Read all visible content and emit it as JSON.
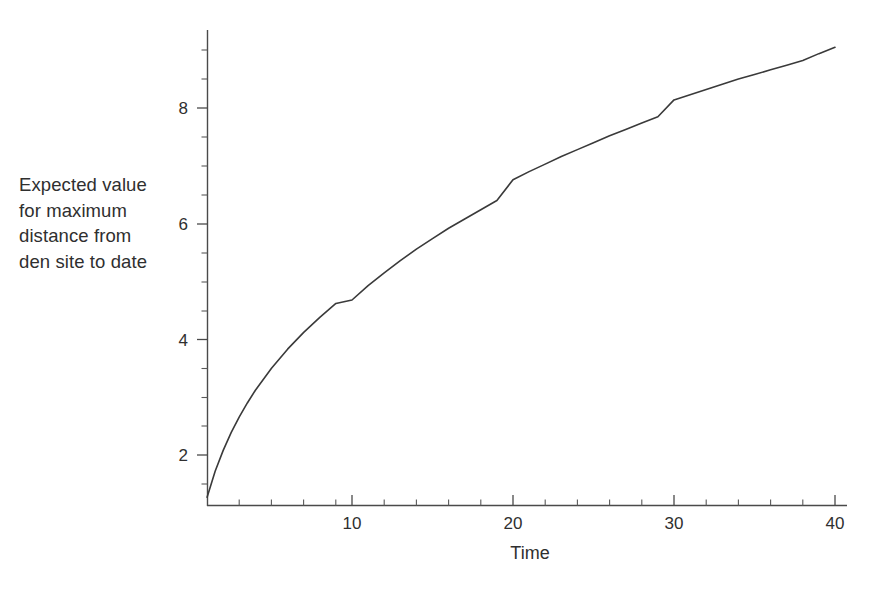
{
  "chart_data": {
    "type": "line",
    "title": "",
    "subtitle": "",
    "xlabel": "Time",
    "ylabel": "Expected value\nfor maximum\ndistance from\nden site to date",
    "xlim": [
      0,
      41.5
    ],
    "ylim": [
      1.0,
      9.3
    ],
    "grid": false,
    "legend": null,
    "legend_position": "none",
    "line_color": "#3a3a3a",
    "axis_color": "#4a4a4a",
    "background_color": "#ffffff",
    "x_ticks_major": [
      10,
      20,
      30,
      40
    ],
    "x_tick_labels": [
      "10",
      "20",
      "30",
      "40"
    ],
    "x_ticks_minor": [
      2,
      4,
      6,
      8,
      12,
      14,
      16,
      18,
      22,
      24,
      26,
      28,
      32,
      34,
      36,
      38,
      40
    ],
    "y_ticks_major": [
      2,
      4,
      6,
      8
    ],
    "y_tick_labels": [
      "2",
      "4",
      "6",
      "8"
    ],
    "y_ticks_minor": [
      1.5,
      2.5,
      3,
      3.5,
      4.5,
      5,
      5.5,
      6.5,
      7,
      7.5,
      8.5,
      9
    ],
    "series": [
      {
        "name": "Expected maximum distance",
        "x": [
          1,
          1.5,
          2,
          2.5,
          3,
          3.5,
          4,
          5,
          6,
          7,
          8,
          9,
          10,
          11,
          12,
          13,
          14,
          15,
          16,
          17,
          18,
          19,
          20,
          21,
          22,
          23,
          24,
          25,
          26,
          27,
          28,
          29,
          30,
          31,
          32,
          33,
          34,
          35,
          36,
          37,
          38,
          39,
          40
        ],
        "y": [
          1.27,
          1.72,
          2.08,
          2.39,
          2.66,
          2.9,
          3.12,
          3.5,
          3.83,
          4.12,
          4.38,
          4.62,
          4.68,
          4.93,
          5.15,
          5.36,
          5.56,
          5.74,
          5.92,
          6.08,
          6.24,
          6.4,
          6.76,
          6.9,
          7.03,
          7.16,
          7.28,
          7.4,
          7.52,
          7.63,
          7.74,
          7.85,
          8.14,
          8.23,
          8.32,
          8.41,
          8.5,
          8.58,
          8.66,
          8.74,
          8.82,
          8.94,
          9.05
        ]
      }
    ],
    "annotations": []
  },
  "axes": {
    "x_title": "Time",
    "y_title_lines": [
      "Expected value",
      "for maximum",
      "distance from",
      "den site to date"
    ],
    "x_tick_labels": [
      "10",
      "20",
      "30",
      "40"
    ],
    "y_tick_labels": [
      "2",
      "4",
      "6",
      "8"
    ]
  }
}
